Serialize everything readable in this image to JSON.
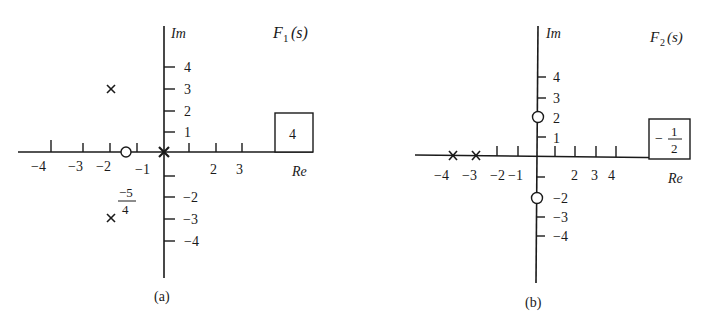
{
  "panels": [
    {
      "id": "a",
      "caption": "(a)",
      "function_label": "F",
      "function_sub": "1",
      "function_arg": "(s)",
      "axis_im": "Im",
      "axis_re": "Re",
      "gain": "4",
      "re_ticks_neg": [
        "−4",
        "−3",
        "−2",
        "−1"
      ],
      "re_ticks_pos": [
        "2",
        "3"
      ],
      "im_ticks_pos": [
        "4",
        "3",
        "2",
        "1"
      ],
      "im_ticks_neg": [
        "−2",
        "−3",
        "−4"
      ],
      "zero_annotation_num": "−5",
      "zero_annotation_den": "4",
      "poles": [
        {
          "re": -1.5,
          "im": 3
        },
        {
          "re": -1.5,
          "im": -3
        },
        {
          "re": 0,
          "im": 0
        }
      ],
      "zeros": [
        {
          "re": -1.25,
          "im": 0
        }
      ]
    },
    {
      "id": "b",
      "caption": "(b)",
      "function_label": "F",
      "function_sub": "2",
      "function_arg": "(s)",
      "axis_im": "Im",
      "axis_re": "Re",
      "gain_sign": "−",
      "gain_num": "1",
      "gain_den": "2",
      "re_ticks_neg": [
        "−4",
        "−3",
        "−2",
        "−1"
      ],
      "re_ticks_pos": [
        "2",
        "3",
        "4"
      ],
      "im_ticks_pos": [
        "4",
        "3",
        "2",
        "1"
      ],
      "im_ticks_neg": [
        "−2",
        "−3",
        "−4"
      ],
      "poles": [
        {
          "re": -4,
          "im": 0
        },
        {
          "re": -3,
          "im": 0
        }
      ],
      "zeros": [
        {
          "re": 0,
          "im": 2
        },
        {
          "re": 0,
          "im": -2
        }
      ]
    }
  ]
}
